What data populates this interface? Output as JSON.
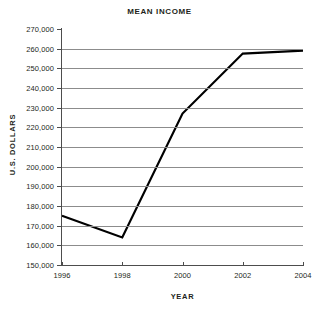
{
  "chart_data": {
    "type": "line",
    "title": "MEAN INCOME",
    "xlabel": "YEAR",
    "ylabel": "U.S. DOLLARS",
    "x": [
      1996,
      1998,
      2000,
      2002,
      2004
    ],
    "categories": [
      "1996",
      "1998",
      "2000",
      "2002",
      "2004"
    ],
    "values": [
      175000,
      164000,
      227000,
      257500,
      259000
    ],
    "series": [
      {
        "name": "Mean Income",
        "values": [
          175000,
          164000,
          227000,
          257500,
          259000
        ],
        "color": "#000000"
      }
    ],
    "xlim": [
      1996,
      2004
    ],
    "ylim": [
      150000,
      270000
    ],
    "ytick_step": 10000,
    "ytick_labels": [
      "270,000",
      "260,000",
      "250,000",
      "240,000",
      "230,000",
      "220,000",
      "210,000",
      "200,000",
      "190,000",
      "180,000",
      "170,000",
      "160,000",
      "150,000"
    ],
    "ytick_values": [
      270000,
      260000,
      250000,
      240000,
      230000,
      220000,
      210000,
      200000,
      190000,
      180000,
      170000,
      160000,
      150000
    ],
    "xtick_labels": [
      "1996",
      "1998",
      "2000",
      "2002",
      "2004"
    ],
    "grid": "horizontal",
    "legend": "none",
    "grid_color": "#8c8c8c",
    "axis_color": "#4d4d4d",
    "line_color": "#000000",
    "background": "#ffffff"
  }
}
